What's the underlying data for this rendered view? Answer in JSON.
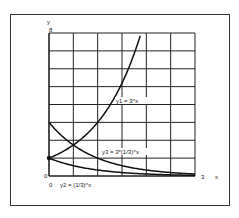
{
  "chart_data": {
    "type": "line",
    "title": "",
    "xlabel": "x",
    "ylabel": "y",
    "xlim": [
      0,
      3
    ],
    "ylim": [
      0,
      8
    ],
    "grid": true,
    "grid_x_step": 0.5,
    "grid_y_step": 1,
    "tick_labels": {
      "x_origin": "0",
      "x_max": "3",
      "y_origin": "0",
      "y_max": "8"
    },
    "series": [
      {
        "name": "y1 = 3^x",
        "x": [
          0,
          0.5,
          1,
          1.5,
          1.89
        ],
        "values": [
          1,
          1.73,
          3,
          5.2,
          8
        ]
      },
      {
        "name": "y2 = (1/3)^x",
        "x": [
          0,
          0.5,
          1,
          1.5,
          2,
          2.5,
          3
        ],
        "values": [
          1,
          0.58,
          0.33,
          0.19,
          0.11,
          0.06,
          0.04
        ]
      },
      {
        "name": "y3 = 3*(1/3)^x",
        "x": [
          0,
          0.5,
          1,
          1.5,
          2,
          2.5,
          3
        ],
        "values": [
          3,
          1.73,
          1,
          0.58,
          0.33,
          0.19,
          0.11
        ]
      }
    ],
    "annotations": [
      {
        "text": "y1 = 3^x",
        "near": [
          1.1,
          4.3
        ]
      },
      {
        "text": "y3 = 3*(1/3)^x",
        "near": [
          1.1,
          1.5
        ]
      },
      {
        "text": "y2 = (1/3)^x",
        "near": [
          0.5,
          -0.5
        ]
      }
    ],
    "colors": {
      "line": "#111111",
      "grid": "#222222",
      "background": "#ffffff"
    }
  },
  "labels": {
    "y_axis": "y",
    "x_axis": "x",
    "y_max": "8",
    "y_origin": "0",
    "x_origin": "0",
    "x_max": "3",
    "y1": "y1 = 3^x",
    "y2": "y2 = (1/3)^x",
    "y3": "y3 = 3*(1/3)^x"
  }
}
